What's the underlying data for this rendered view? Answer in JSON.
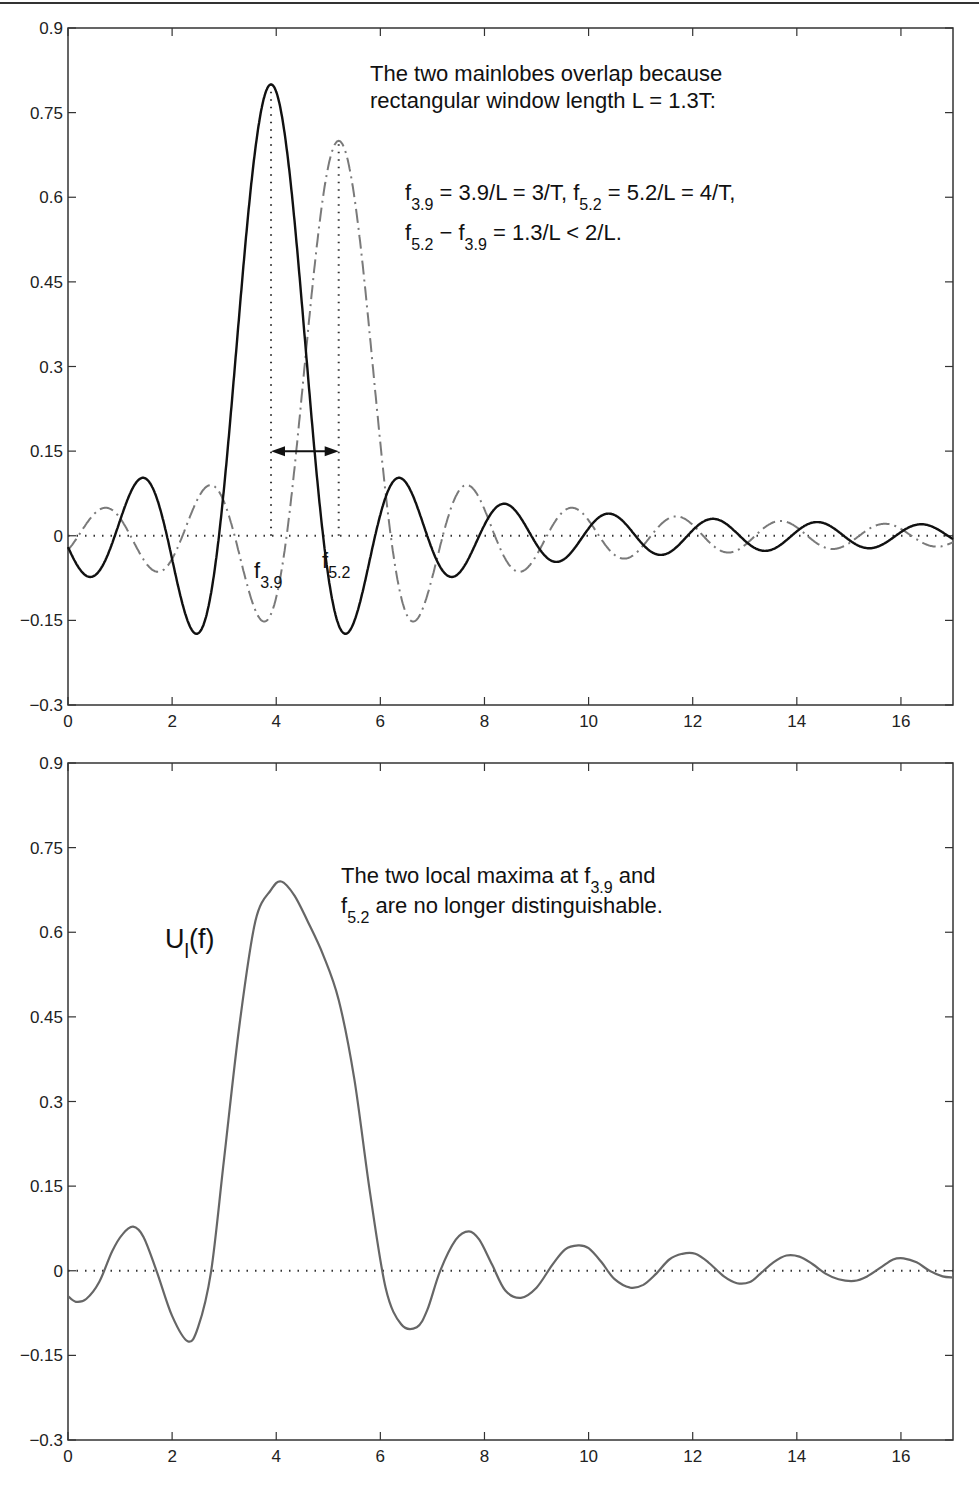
{
  "chart_data": [
    {
      "type": "line",
      "title": "",
      "xlabel": "",
      "ylabel": "",
      "xlim": [
        0,
        17
      ],
      "ylim": [
        -0.3,
        0.9
      ],
      "xticks": [
        0,
        2,
        4,
        6,
        8,
        10,
        12,
        14,
        16
      ],
      "yticks": [
        -0.3,
        -0.15,
        0,
        0.15,
        0.3,
        0.45,
        0.6,
        0.75,
        0.9
      ],
      "ytick_labels": [
        "−0.3",
        "−0.15",
        "0",
        "0.15",
        "0.3",
        "0.45",
        "0.6",
        "0.75",
        "0.9"
      ],
      "grid": false,
      "series": [
        {
          "name": "sinc centered at f3.9",
          "style": "solid",
          "color": "#111111",
          "amplitude": 0.8,
          "center": 3.9,
          "formula": "0.8*sinc(f-3.9)"
        },
        {
          "name": "sinc centered at f5.2",
          "style": "dash-dot",
          "color": "#777777",
          "amplitude": 0.7,
          "center": 5.2,
          "formula": "0.7*sinc(f-5.2)"
        },
        {
          "name": "zero line",
          "style": "dotted",
          "color": "#333333",
          "value": 0
        }
      ],
      "vlines": [
        {
          "x": 3.9,
          "from": 0,
          "to": 0.8,
          "style": "dotted"
        },
        {
          "x": 5.2,
          "from": 0,
          "to": 0.7,
          "style": "dotted"
        }
      ],
      "double_arrow": {
        "x1": 3.9,
        "x2": 5.2,
        "y": 0.15
      },
      "annotations": {
        "line1": "The two mainlobes overlap because",
        "line2": "rectangular window length L = 1.3T:",
        "eq1": {
          "f": "f",
          "sub1": "3.9",
          "mid": " = 3.9/L = 3/T, ",
          "f2": "f",
          "sub2": "5.2",
          "end": " = 5.2/L = 4/T,"
        },
        "eq2": {
          "f": "f",
          "sub1": "5.2",
          "mid": " − ",
          "f2": "f",
          "sub2": "3.9",
          "end": " = 1.3/L < 2/L."
        },
        "label_f39": {
          "f": "f",
          "sub": "3.9"
        },
        "label_f52": {
          "f": "f",
          "sub": "5.2"
        }
      }
    },
    {
      "type": "line",
      "title": "",
      "xlabel": "",
      "ylabel": "",
      "xlim": [
        0,
        17
      ],
      "ylim": [
        -0.3,
        0.9
      ],
      "xticks": [
        0,
        2,
        4,
        6,
        8,
        10,
        12,
        14,
        16
      ],
      "yticks": [
        -0.3,
        -0.15,
        0,
        0.15,
        0.3,
        0.45,
        0.6,
        0.75,
        0.9
      ],
      "ytick_labels": [
        "−0.3",
        "−0.15",
        "0",
        "0.15",
        "0.3",
        "0.45",
        "0.6",
        "0.75",
        "0.9"
      ],
      "grid": false,
      "series": [
        {
          "name": "U_l(f)",
          "style": "solid",
          "color": "#666666",
          "x": [
            0,
            0.15,
            0.35,
            0.6,
            0.85,
            1.05,
            1.25,
            1.45,
            1.7,
            2.0,
            2.3,
            2.5,
            2.75,
            3.0,
            3.3,
            3.6,
            3.9,
            4.1,
            4.35,
            4.6,
            4.9,
            5.2,
            5.5,
            5.8,
            6.1,
            6.4,
            6.7,
            6.9,
            7.15,
            7.45,
            7.7,
            7.9,
            8.15,
            8.4,
            8.7,
            9.0,
            9.3,
            9.55,
            9.8,
            10.0,
            10.25,
            10.5,
            10.8,
            11.05,
            11.3,
            11.55,
            11.8,
            12.05,
            12.3,
            12.6,
            12.85,
            13.1,
            13.3,
            13.55,
            13.8,
            14.05,
            14.3,
            14.55,
            14.8,
            15.1,
            15.35,
            15.6,
            15.85,
            16.05,
            16.3,
            16.55,
            16.8,
            17.0
          ],
          "y": [
            -0.045,
            -0.055,
            -0.05,
            -0.02,
            0.035,
            0.065,
            0.078,
            0.06,
            0.0,
            -0.08,
            -0.125,
            -0.1,
            0.0,
            0.2,
            0.44,
            0.62,
            0.675,
            0.69,
            0.665,
            0.62,
            0.56,
            0.48,
            0.34,
            0.14,
            -0.03,
            -0.095,
            -0.1,
            -0.07,
            0.0,
            0.055,
            0.07,
            0.055,
            0.01,
            -0.035,
            -0.048,
            -0.03,
            0.01,
            0.038,
            0.045,
            0.04,
            0.015,
            -0.015,
            -0.03,
            -0.025,
            -0.005,
            0.02,
            0.03,
            0.03,
            0.015,
            -0.01,
            -0.022,
            -0.02,
            -0.005,
            0.015,
            0.027,
            0.025,
            0.012,
            -0.005,
            -0.015,
            -0.018,
            -0.01,
            0.005,
            0.02,
            0.022,
            0.015,
            0.0,
            -0.01,
            -0.012
          ]
        },
        {
          "name": "zero line",
          "style": "dotted",
          "color": "#333333",
          "value": 0
        }
      ],
      "annotations": {
        "curve_label": {
          "U": "U",
          "sub": "l",
          "rest": "(f)"
        },
        "line1": {
          "text": "The two local maxima at ",
          "f": "f",
          "sub": "3.9",
          "end": " and"
        },
        "line2": {
          "f": "f",
          "sub": "5.2",
          "text": " are no longer distinguishable."
        }
      }
    }
  ]
}
